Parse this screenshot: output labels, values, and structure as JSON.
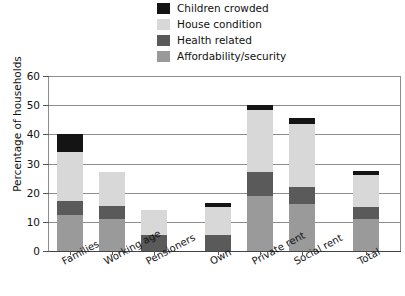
{
  "chart_data": {
    "type": "bar",
    "stacked": true,
    "title": "",
    "xlabel": "",
    "ylabel": "Percentage of households",
    "ylim": [
      0,
      60
    ],
    "yticks": [
      0,
      10,
      20,
      30,
      40,
      50,
      60
    ],
    "grid": true,
    "legend_position": "top-center",
    "categories": [
      "Families",
      "Working age",
      "Pensioners",
      "Own",
      "Private rent",
      "Social rent",
      "Total"
    ],
    "series": [
      {
        "name": "Affordability/security",
        "color": "#9a9a9a",
        "values": [
          12.5,
          11.0,
          0.0,
          0.0,
          19.0,
          16.0,
          11.0
        ]
      },
      {
        "name": "Health related",
        "color": "#5a5a5a",
        "values": [
          4.5,
          4.5,
          5.5,
          5.5,
          8.0,
          6.0,
          4.0
        ]
      },
      {
        "name": "House condition",
        "color": "#d8d8d8",
        "values": [
          17.0,
          11.5,
          8.5,
          9.5,
          21.5,
          21.5,
          11.0
        ]
      },
      {
        "name": "Children crowded",
        "color": "#141414",
        "values": [
          6.0,
          0.0,
          0.0,
          1.5,
          1.5,
          2.0,
          1.5
        ]
      }
    ],
    "totals": [
      40.0,
      27.0,
      14.0,
      16.5,
      50.0,
      45.5,
      27.5
    ]
  },
  "legend": {
    "items": [
      {
        "label": "Children crowded",
        "color": "#141414"
      },
      {
        "label": "House condition",
        "color": "#d8d8d8"
      },
      {
        "label": "Health related",
        "color": "#5a5a5a"
      },
      {
        "label": "Affordability/security",
        "color": "#9a9a9a"
      }
    ]
  },
  "axis": {
    "y_title": "Percentage of households",
    "y_ticks": [
      "0",
      "10",
      "20",
      "30",
      "40",
      "50",
      "60"
    ],
    "x_labels": [
      "Families",
      "Working age",
      "Pensioners",
      "Own",
      "Private rent",
      "Social rent",
      "Total"
    ]
  }
}
